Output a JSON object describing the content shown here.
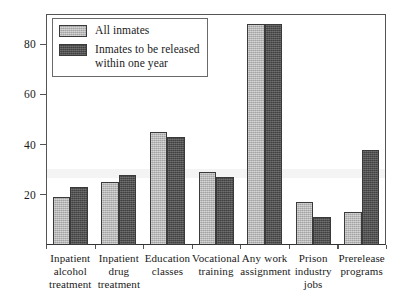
{
  "chart_data": {
    "type": "bar",
    "title": "",
    "subtitle": "",
    "xlabel": "",
    "ylabel": "",
    "ylim": [
      0,
      92
    ],
    "yticks": [
      20,
      40,
      60,
      80
    ],
    "ytick_labels": [
      "20",
      "40",
      "60",
      "80"
    ],
    "grid": false,
    "legend_position": "top-left",
    "categories": [
      "Inpatient\nalcohol\ntreatment",
      "Inpatient\ndrug\ntreatment",
      "Education\nclasses",
      "Vocational\ntraining",
      "Any work\nassignment",
      "Prison\nindustry\njobs",
      "Prerelease\nprograms"
    ],
    "series": [
      {
        "name": "All inmates",
        "color": "#b3b3b3",
        "values": [
          19,
          25,
          45,
          29,
          88,
          17,
          13
        ]
      },
      {
        "name": "Inmates to be released\nwithin one year",
        "color": "#4d4d4d",
        "values": [
          23,
          28,
          43,
          27,
          88,
          11,
          38
        ]
      }
    ]
  },
  "legend": {
    "items": [
      {
        "label": "All inmates",
        "swatch": "legend-swatch-all-inmates"
      },
      {
        "label": "Inmates to be released\nwithin one year",
        "swatch": "legend-swatch-released-within-one-year"
      }
    ]
  },
  "axes": {
    "y": {
      "tick_labels": [
        "20",
        "40",
        "60",
        "80"
      ]
    }
  }
}
